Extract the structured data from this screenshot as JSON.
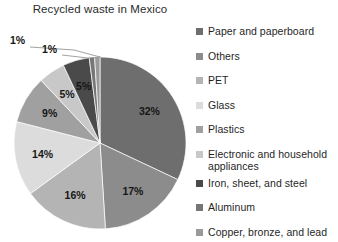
{
  "chart_data": {
    "type": "pie",
    "title": "Recycled waste in Mexico",
    "xlabel": "",
    "ylabel": "",
    "grid": false,
    "legend_position": "right",
    "value_unit": "%",
    "categories": [
      "Paper and paperboard",
      "Others",
      "PET",
      "Glass",
      "Plastics",
      "Electronic and household appliances",
      "Iron, sheet, and steel",
      "Aluminum",
      "Copper, bronze, and lead"
    ],
    "values": [
      32,
      17,
      16,
      14,
      9,
      5,
      5,
      1,
      1
    ],
    "labels": [
      "32%",
      "17%",
      "16%",
      "14%",
      "9%",
      "5%",
      "5%",
      "1%",
      "1%"
    ],
    "colors": [
      "#6e6e6e",
      "#8c8c8c",
      "#b4b4b4",
      "#dcdcdc",
      "#a0a0a0",
      "#c8c8c8",
      "#4a4a4a",
      "#767676",
      "#9a9a9a"
    ],
    "annotations": [
      {
        "text": "1%",
        "series": "Aluminum"
      },
      {
        "text": "1%",
        "series": "Copper, bronze, and lead"
      }
    ]
  },
  "legend": {
    "items": [
      {
        "label": "Paper and paperboard",
        "color": "#6e6e6e"
      },
      {
        "label": "Others",
        "color": "#8c8c8c"
      },
      {
        "label": "PET",
        "color": "#b4b4b4"
      },
      {
        "label": "Glass",
        "color": "#dcdcdc"
      },
      {
        "label": "Plastics",
        "color": "#a0a0a0"
      },
      {
        "label": "Electronic and household appliances",
        "color": "#c8c8c8"
      },
      {
        "label": "Iron, sheet, and steel",
        "color": "#4a4a4a"
      },
      {
        "label": "Aluminum",
        "color": "#767676"
      },
      {
        "label": "Copper, bronze, and lead",
        "color": "#9a9a9a"
      }
    ]
  }
}
